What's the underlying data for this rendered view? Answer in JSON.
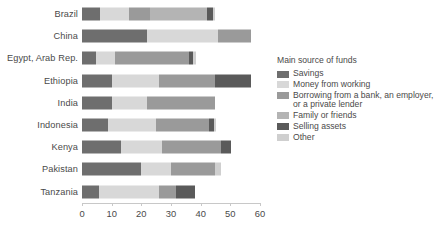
{
  "chart_data": {
    "type": "bar",
    "orientation": "horizontal",
    "stacked": true,
    "title": "",
    "xlabel": "",
    "ylabel": "",
    "xlim": [
      0,
      60
    ],
    "xticks": [
      0,
      10,
      20,
      30,
      40,
      50,
      60
    ],
    "xtick_labels": [
      "0",
      "10",
      "20",
      "30",
      "40",
      "50",
      "60"
    ],
    "grid": false,
    "legend_position": "right",
    "legend_title": "Main source of funds",
    "categories": [
      "Brazil",
      "China",
      "Egypt, Arab Rep.",
      "Ethiopia",
      "India",
      "Indonesia",
      "Kenya",
      "Pakistan",
      "Tanzania"
    ],
    "series": [
      {
        "name": "Savings",
        "color": "#6e6e6e",
        "values": [
          6.0,
          22.0,
          4.8,
          10.0,
          10.0,
          8.8,
          13.0,
          20.0,
          5.8
        ]
      },
      {
        "name": "Money from working",
        "color": "#d8d8d8",
        "values": [
          10.0,
          24.0,
          6.2,
          16.0,
          12.0,
          16.0,
          14.0,
          10.0,
          20.0
        ]
      },
      {
        "name": "Borrowing from a bank, an employer, or a private lender",
        "color": "#9a9a9a",
        "values": [
          7.0,
          11.0,
          25.0,
          19.0,
          23.0,
          18.0,
          20.0,
          15.0,
          6.0
        ]
      },
      {
        "name": "Family or friends",
        "color": "#b4b4b4",
        "values": [
          19.0,
          0.0,
          0.0,
          0.0,
          0.0,
          0.0,
          0.0,
          0.0,
          0.0
        ]
      },
      {
        "name": "Selling assets",
        "color": "#5a5a5a",
        "values": [
          2.0,
          0.0,
          1.5,
          12.0,
          0.0,
          1.8,
          3.2,
          0.0,
          6.2
        ]
      },
      {
        "name": "Other",
        "color": "#cfcfcf",
        "values": [
          1.0,
          0.0,
          0.8,
          0.0,
          0.0,
          0.6,
          0.0,
          2.0,
          0.0
        ]
      }
    ],
    "totals": [
      45.0,
      57.0,
      38.3,
      57.0,
      45.0,
      45.2,
      50.2,
      47.0,
      38.0
    ]
  }
}
